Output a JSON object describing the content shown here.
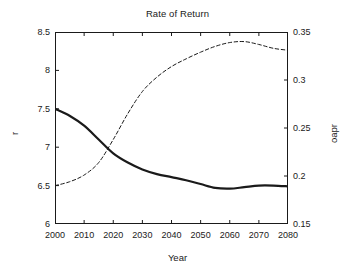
{
  "chart_data": {
    "type": "line",
    "title": "Rate of Return",
    "xlabel": "Year",
    "ylabel": "r",
    "ylabel_right": "oapr",
    "grid": false,
    "legend": "none",
    "xlim": [
      2000,
      2080
    ],
    "ylim": [
      6,
      8.5
    ],
    "ylim_right": [
      0.15,
      0.35
    ],
    "xticks": [
      "2000",
      "2010",
      "2020",
      "2030",
      "2040",
      "2050",
      "2060",
      "2070",
      "2080"
    ],
    "xtick_values": [
      2000,
      2010,
      2020,
      2030,
      2040,
      2050,
      2060,
      2070,
      2080
    ],
    "yticks_left": [
      "8.5",
      "8",
      "7.5",
      "7",
      "6.5",
      "6"
    ],
    "ytick_values_left": [
      8.5,
      8,
      7.5,
      7,
      6.5,
      6
    ],
    "yticks_right": [
      "0.35",
      "0.3",
      "0.25",
      "0.2",
      "0.15"
    ],
    "ytick_values_right": [
      0.35,
      0.3,
      0.25,
      0.2,
      0.15
    ],
    "x": [
      2000,
      2005,
      2010,
      2015,
      2020,
      2025,
      2030,
      2035,
      2040,
      2045,
      2050,
      2055,
      2060,
      2065,
      2070,
      2075,
      2080
    ],
    "series": [
      {
        "name": "r",
        "axis": "left",
        "style": "solid",
        "width": 2.2,
        "color": "#1a1a1a",
        "values": [
          7.5,
          7.41,
          7.28,
          7.1,
          6.92,
          6.8,
          6.71,
          6.65,
          6.61,
          6.57,
          6.52,
          6.47,
          6.46,
          6.48,
          6.5,
          6.5,
          6.49
        ]
      },
      {
        "name": "oapr",
        "axis": "right",
        "style": "dashed",
        "width": 1.0,
        "color": "#1a1a1a",
        "values": [
          0.19,
          0.194,
          0.201,
          0.214,
          0.238,
          0.265,
          0.288,
          0.303,
          0.314,
          0.322,
          0.329,
          0.335,
          0.339,
          0.34,
          0.337,
          0.333,
          0.331
        ]
      }
    ]
  }
}
